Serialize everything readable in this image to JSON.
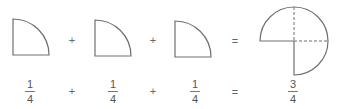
{
  "shapes": [
    {
      "type": "quarter-circle",
      "label": "one quarter"
    },
    {
      "type": "quarter-circle",
      "label": "one quarter"
    },
    {
      "type": "quarter-circle",
      "label": "one quarter"
    },
    {
      "type": "three-quarter-circle",
      "label": "three quarters"
    }
  ],
  "shape_operators": [
    "+",
    "+",
    "="
  ],
  "fractions": [
    {
      "numerator": "1",
      "denominator": "4"
    },
    {
      "numerator": "1",
      "denominator": "4"
    },
    {
      "numerator": "1",
      "denominator": "4"
    },
    {
      "numerator": "3",
      "denominator": "4"
    }
  ],
  "fraction_operators": [
    "+",
    "+",
    "="
  ],
  "colors": {
    "stroke": "#707070",
    "text": "#555555"
  }
}
